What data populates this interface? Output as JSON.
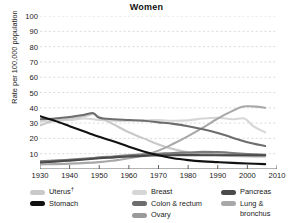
{
  "chart_data": {
    "type": "line",
    "title": "Women",
    "xlabel": "",
    "ylabel": "Rate per 100,000 population",
    "xlim": [
      1930,
      2010
    ],
    "ylim": [
      0,
      100
    ],
    "xticks": [
      1930,
      1940,
      1950,
      1960,
      1970,
      1980,
      1990,
      2000,
      2010
    ],
    "yticks": [
      10,
      20,
      30,
      40,
      50,
      60,
      70,
      80,
      90,
      100
    ],
    "grid": "horizontal-dashed",
    "legend_position": "bottom",
    "series": [
      {
        "name": "Uterus†",
        "color": "#c9c9c9",
        "x": [
          1930,
          1935,
          1940,
          1945,
          1948,
          1950,
          1955,
          1960,
          1965,
          1970,
          1975,
          1980,
          1985,
          1990,
          1995,
          2000,
          2006
        ],
        "values": [
          28.5,
          31.5,
          33.0,
          34.5,
          36.0,
          34.0,
          29.0,
          24.0,
          20.0,
          16.0,
          13.0,
          11.0,
          10.0,
          9.0,
          8.5,
          8.2,
          8.0
        ]
      },
      {
        "name": "Stomach",
        "color": "#111111",
        "x": [
          1930,
          1935,
          1940,
          1945,
          1950,
          1955,
          1960,
          1965,
          1970,
          1975,
          1980,
          1985,
          1990,
          1995,
          2000,
          2006
        ],
        "values": [
          34.5,
          31.5,
          28.0,
          24.5,
          21.0,
          18.0,
          14.5,
          11.5,
          9.0,
          7.0,
          5.8,
          5.0,
          4.5,
          4.0,
          3.6,
          3.2
        ]
      },
      {
        "name": "Breast",
        "color": "#d6d6d6",
        "x": [
          1930,
          1935,
          1940,
          1945,
          1950,
          1955,
          1960,
          1965,
          1970,
          1975,
          1980,
          1985,
          1990,
          1995,
          1999,
          2002,
          2006
        ],
        "values": [
          31.0,
          31.5,
          32.0,
          33.0,
          32.0,
          31.5,
          31.5,
          31.8,
          32.0,
          31.5,
          31.8,
          33.0,
          33.5,
          32.5,
          33.0,
          28.0,
          24.0
        ]
      },
      {
        "name": "Colon & rectum",
        "color": "#7a7a7a",
        "x": [
          1930,
          1935,
          1940,
          1945,
          1950,
          1955,
          1960,
          1965,
          1970,
          1975,
          1980,
          1985,
          1990,
          1995,
          2000,
          2006
        ],
        "values": [
          5.0,
          5.5,
          6.0,
          6.5,
          7.5,
          8.2,
          9.0,
          9.6,
          10.0,
          10.5,
          10.8,
          11.2,
          11.0,
          10.5,
          9.8,
          9.2
        ]
      },
      {
        "name": "Ovary",
        "color": "#9a9a9a",
        "x": [
          1930,
          1935,
          1940,
          1945,
          1950,
          1955,
          1960,
          1965,
          1970,
          1975,
          1980,
          1985,
          1990,
          1995,
          2000,
          2006
        ],
        "values": [
          4.5,
          5.2,
          6.0,
          6.8,
          7.5,
          8.0,
          8.6,
          9.0,
          9.3,
          9.5,
          9.6,
          9.6,
          9.5,
          9.3,
          9.0,
          8.8
        ]
      },
      {
        "name": "Pancreas",
        "color": "#4a4a4a",
        "x": [
          1930,
          1935,
          1940,
          1945,
          1950,
          1955,
          1960,
          1965,
          1970,
          1975,
          1980,
          1985,
          1990,
          1995,
          2000,
          2006
        ],
        "values": [
          4.2,
          4.8,
          5.5,
          6.2,
          7.0,
          7.6,
          8.2,
          8.6,
          8.9,
          9.0,
          9.1,
          9.0,
          9.0,
          9.0,
          9.0,
          9.0
        ]
      },
      {
        "name": "Lung & bronchus",
        "color": "#a8a8a8",
        "x": [
          1930,
          1940,
          1950,
          1955,
          1960,
          1965,
          1970,
          1975,
          1980,
          1985,
          1990,
          1995,
          1998,
          2000,
          2003,
          2006
        ],
        "values": [
          3.0,
          3.5,
          4.5,
          5.5,
          7.0,
          9.0,
          12.0,
          16.5,
          21.5,
          27.0,
          33.0,
          38.0,
          40.5,
          41.0,
          40.8,
          40.0
        ]
      },
      {
        "name": "Colon & rectum (upper)",
        "color": "#6d6d6d",
        "hidden_from_legend": true,
        "x": [
          1930,
          1935,
          1940,
          1945,
          1948,
          1950,
          1955,
          1960,
          1965,
          1970,
          1975,
          1980,
          1985,
          1990,
          1995,
          2000,
          2006
        ],
        "values": [
          32.5,
          33.0,
          34.0,
          35.5,
          36.5,
          33.5,
          32.5,
          32.0,
          31.5,
          30.5,
          29.5,
          28.0,
          26.0,
          23.5,
          20.5,
          17.5,
          15.0
        ]
      }
    ]
  },
  "legend": {
    "col1": [
      {
        "label": "Uterus",
        "dagger": "†",
        "color": "#c9c9c9"
      },
      {
        "label": "Stomach",
        "dagger": "",
        "color": "#111111"
      }
    ],
    "col2": [
      {
        "label": "Breast",
        "dagger": "",
        "color": "#d6d6d6"
      },
      {
        "label": "Colon & rectum",
        "dagger": "",
        "color": "#6d6d6d"
      },
      {
        "label": "Ovary",
        "dagger": "",
        "color": "#9a9a9a"
      }
    ],
    "col3": [
      {
        "label": "Pancreas",
        "dagger": "",
        "color": "#4a4a4a"
      },
      {
        "label": "Lung &",
        "dagger": "",
        "color": "#a8a8a8"
      }
    ],
    "col3_continuation": "bronchus"
  }
}
